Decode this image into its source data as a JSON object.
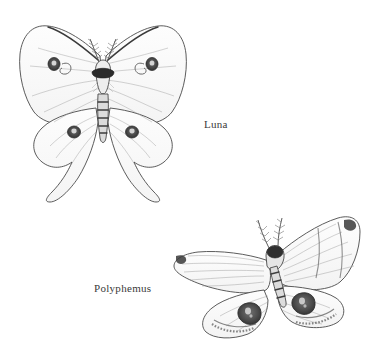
{
  "page": {
    "background_color": "#ffffff",
    "width": 382,
    "height": 361,
    "medium": "pencil-line-drawing"
  },
  "figures": [
    {
      "id": "luna",
      "label": "Luna",
      "label_color": "#3a3a3a",
      "position": {
        "x": 8,
        "y": 12,
        "width": 190,
        "height": 192
      },
      "orientation": "upright, symmetric, head up",
      "features": {
        "forewing_eyespots": 2,
        "hindwing_eyespots": 2,
        "total_eyespots": 4,
        "has_tails": true,
        "tail_count": 2,
        "antennae": "feathery bipectinate pair",
        "body": "banded furry abdomen with dark thorax collar",
        "wing_tone": "#fafafa",
        "outline_color": "#4a4a4a",
        "eyespot_color": "#4d4d4d"
      }
    },
    {
      "id": "polyphemus",
      "label": "Polyphemus",
      "label_color": "#3a3a3a",
      "position": {
        "x": 168,
        "y": 206,
        "width": 206,
        "height": 145
      },
      "orientation": "tilted, wings spread wide, head up-right",
      "features": {
        "forewing_eyespots": 0,
        "hindwing_eyespots": 2,
        "total_eyespots": 2,
        "has_tails": false,
        "tail_count": 0,
        "antennae": "feathery bipectinate pair",
        "body": "stout banded abdomen",
        "wing_tone": "#fbfbfb",
        "outline_color": "#4a4a4a",
        "eyespot_color": "#555555",
        "apex_marking": "dark smudge at forewing tips",
        "hindwing_band": "dark hatched submarginal band"
      }
    }
  ],
  "labels": {
    "luna": "Luna",
    "polyphemus": "Polyphemus"
  }
}
